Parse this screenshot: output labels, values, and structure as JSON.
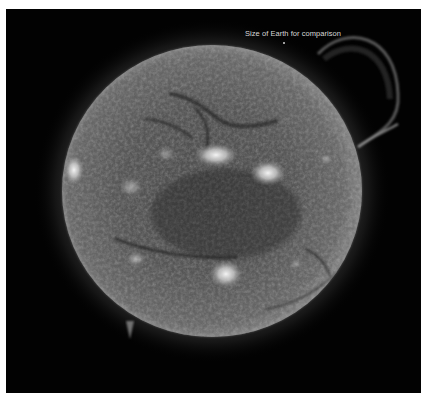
{
  "image": {
    "subject": "Sun (extreme ultraviolet view) with Earth shown for scale",
    "background_color": "#020202",
    "border_color": "#ffffff"
  },
  "caption": {
    "text": "Size of Earth for comparison",
    "color": "#d8d8d8"
  },
  "earth": {
    "label": "Earth",
    "color": "#cfcfcf"
  },
  "sun": {
    "disk_color": "#6a6a6a",
    "limb_color": "#8a8a8a",
    "active_region_color": "#f0f0f0",
    "filament_color": "#2a2a2a",
    "features": {
      "active_regions": [
        "west-limb region",
        "north-central region",
        "north-east region",
        "southern region"
      ],
      "prominences": [
        "north-east loop prominence",
        "south-west spike prominence"
      ]
    }
  }
}
